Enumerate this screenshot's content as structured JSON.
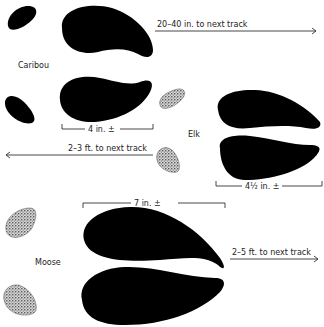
{
  "diagram": {
    "type": "animal-track-comparison",
    "colors": {
      "hoof": "#000000",
      "dewclaw_stipple": "#888888",
      "line": "#333333",
      "text": "#222222"
    },
    "tracks": [
      {
        "animal": "Caribou",
        "width_label": "4 in. ±",
        "stride_label": "20–40 in. to next track",
        "stride_direction": "right"
      },
      {
        "animal": "Elk",
        "width_label": "4½ in. ±",
        "stride_label": "2–3 ft. to next track",
        "stride_direction": "left"
      },
      {
        "animal": "Moose",
        "width_label": "7 in. ±",
        "stride_label": "2–5 ft. to next track",
        "stride_direction": "right"
      }
    ]
  }
}
